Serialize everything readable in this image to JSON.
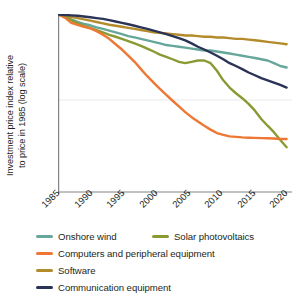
{
  "chart_data": {
    "type": "line",
    "title": "",
    "xlabel": "",
    "ylabel": "Investment price index relative to price in 1985 (log scale)",
    "ylabel_line1": "Investment price index relative",
    "ylabel_line2": "to price in 1985 (log scale)",
    "yscale": "log",
    "ylim": [
      2,
      100
    ],
    "yticks": [
      "100",
      "10",
      "0"
    ],
    "ytick_values": [
      100,
      10,
      0
    ],
    "xlim": [
      1985,
      2021
    ],
    "xticks": [
      "1985",
      "1990",
      "1995",
      "2000",
      "2005",
      "2010",
      "2015",
      "2020"
    ],
    "xtick_values": [
      1985,
      1990,
      1995,
      2000,
      2005,
      2010,
      2015,
      2020
    ],
    "grid": "horizontal-at-10",
    "legend_position": "below",
    "x": [
      1985,
      1986,
      1987,
      1988,
      1989,
      1990,
      1991,
      1992,
      1993,
      1994,
      1995,
      1996,
      1997,
      1998,
      1999,
      2000,
      2001,
      2002,
      2003,
      2004,
      2005,
      2006,
      2007,
      2008,
      2009,
      2010,
      2011,
      2012,
      2013,
      2014,
      2015,
      2016,
      2017,
      2018,
      2019,
      2020,
      2021
    ],
    "series": [
      {
        "name": "Onshore wind",
        "color": "#67a79b",
        "values": [
          100,
          96,
          88,
          82,
          78,
          75,
          71,
          68,
          65,
          62,
          59,
          56,
          54,
          52,
          50,
          48,
          46,
          44,
          43,
          42,
          41,
          40,
          39,
          38,
          38,
          37,
          36,
          35,
          34,
          33,
          32,
          31,
          30,
          29,
          27,
          25,
          24
        ]
      },
      {
        "name": "Solar photovoltaics",
        "color": "#8a9a33",
        "values": [
          100,
          95,
          86,
          79,
          74,
          70,
          66,
          62,
          58,
          55,
          52,
          49,
          46,
          43,
          40,
          37,
          34,
          32,
          30,
          28,
          27,
          28,
          29,
          29,
          27,
          22,
          17,
          14,
          12,
          10.5,
          9,
          7.5,
          6,
          5,
          4.2,
          3.4,
          2.8
        ]
      },
      {
        "name": "Computers and peripheral equipment",
        "color": "#ee7733",
        "values": [
          100,
          92,
          80,
          76,
          72,
          69,
          64,
          58,
          52,
          45,
          39,
          33,
          28,
          23,
          19,
          16,
          13.5,
          11.5,
          9.8,
          8.4,
          7.2,
          6.3,
          5.6,
          5.0,
          4.5,
          4.1,
          3.9,
          3.75,
          3.7,
          3.65,
          3.62,
          3.6,
          3.58,
          3.56,
          3.54,
          3.5,
          3.5
        ]
      },
      {
        "name": "Software",
        "color": "#b38b2b",
        "values": [
          100,
          97,
          94,
          91,
          88,
          85,
          82,
          79,
          76,
          74,
          72,
          70,
          68,
          66,
          64,
          62,
          61,
          60,
          59,
          58,
          57,
          57,
          56,
          55,
          55,
          54,
          54,
          53,
          52,
          52,
          51,
          50,
          49,
          48,
          47,
          46,
          45
        ]
      },
      {
        "name": "Communication equipment",
        "color": "#2b3356",
        "values": [
          100,
          99,
          98,
          97,
          95,
          93,
          91,
          89,
          86,
          83,
          80,
          77,
          74,
          71,
          68,
          65,
          62,
          59,
          56,
          53,
          50,
          46,
          42,
          39,
          36,
          33,
          30,
          27,
          25,
          23,
          21,
          19.5,
          18,
          17,
          16,
          15,
          14
        ]
      }
    ]
  },
  "legend": {
    "items": [
      {
        "label": "Onshore wind",
        "color": "#67a79b"
      },
      {
        "label": "Solar photovoltaics",
        "color": "#8a9a33"
      },
      {
        "label": "Computers and peripheral equipment",
        "color": "#ee7733"
      },
      {
        "label": "Software",
        "color": "#b38b2b"
      },
      {
        "label": "Communication equipment",
        "color": "#2b3356"
      }
    ]
  },
  "axis": {
    "line_color": "#808285",
    "grid_color": "#e8e8e8"
  }
}
